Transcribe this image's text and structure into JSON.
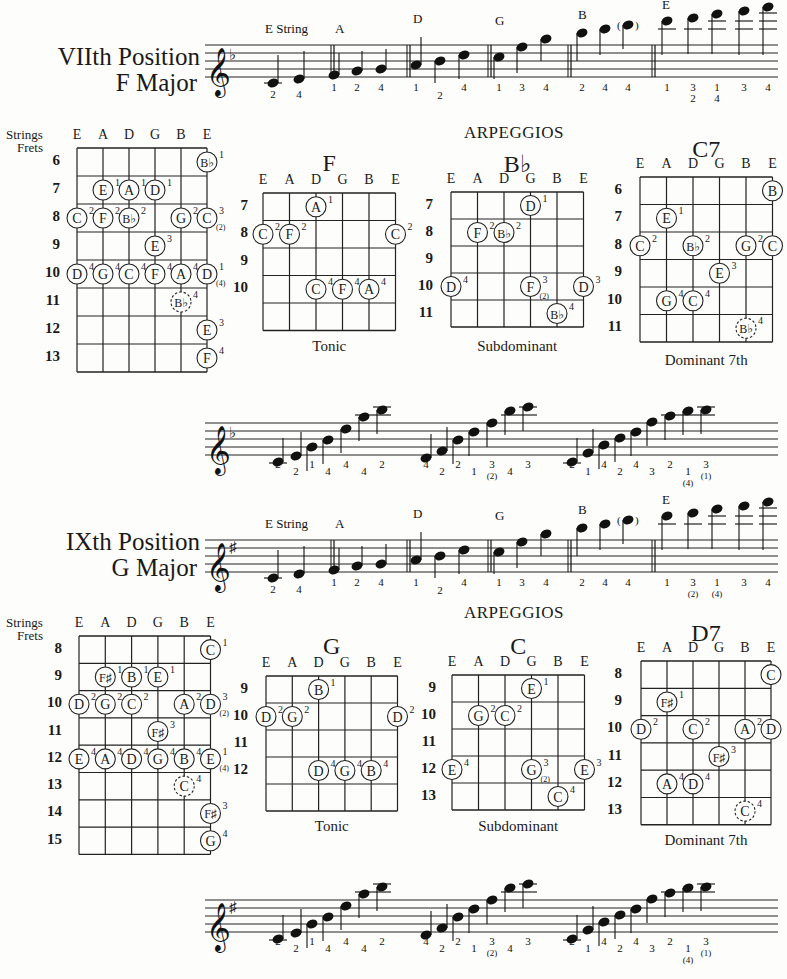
{
  "sections": [
    {
      "title_line1": "VIIth  Position",
      "title_line2": "F  Major",
      "key_signature": "flat",
      "scale_labels": [
        "E String",
        "A",
        "D",
        "G",
        "B",
        "E"
      ],
      "scale_fingerings": [
        [
          "2",
          "4"
        ],
        [
          "1",
          "2",
          "4"
        ],
        [
          "1",
          "2",
          "4"
        ],
        [
          "1",
          "3",
          "4"
        ],
        [
          "2",
          "4",
          "4"
        ],
        [
          "1",
          "3\n2",
          "1\n4",
          "3",
          "4"
        ]
      ],
      "arpeggios_heading": "ARPEGGIOS",
      "fretboard": {
        "strings_label": "Strings",
        "frets_label": "Frets",
        "strings": [
          "E",
          "A",
          "D",
          "G",
          "B",
          "E"
        ],
        "frets": [
          "6",
          "7",
          "8",
          "9",
          "10",
          "11",
          "12",
          "13"
        ],
        "notes": [
          {
            "fret": 0,
            "string": 5,
            "note": "B♭",
            "finger": "1"
          },
          {
            "fret": 1,
            "string": 1,
            "note": "E",
            "finger": "1"
          },
          {
            "fret": 1,
            "string": 2,
            "note": "A",
            "finger": "1"
          },
          {
            "fret": 1,
            "string": 3,
            "note": "D",
            "finger": "1"
          },
          {
            "fret": 2,
            "string": 0,
            "note": "C",
            "finger": "2"
          },
          {
            "fret": 2,
            "string": 1,
            "note": "F",
            "finger": "2"
          },
          {
            "fret": 2,
            "string": 2,
            "note": "B♭",
            "finger": "2"
          },
          {
            "fret": 2,
            "string": 4,
            "note": "G",
            "finger": "2"
          },
          {
            "fret": 2,
            "string": 5,
            "note": "C",
            "finger": "3",
            "alt": "(2)"
          },
          {
            "fret": 3,
            "string": 3,
            "note": "E",
            "finger": "3"
          },
          {
            "fret": 4,
            "string": 0,
            "note": "D",
            "finger": "4"
          },
          {
            "fret": 4,
            "string": 1,
            "note": "G",
            "finger": "4"
          },
          {
            "fret": 4,
            "string": 2,
            "note": "C",
            "finger": "4"
          },
          {
            "fret": 4,
            "string": 3,
            "note": "F",
            "finger": "4"
          },
          {
            "fret": 4,
            "string": 4,
            "note": "A",
            "finger": "4"
          },
          {
            "fret": 4,
            "string": 5,
            "note": "D",
            "finger": "1",
            "alt": "(4)"
          },
          {
            "fret": 5,
            "string": 4,
            "note": "B♭",
            "finger": "4",
            "dashed": true
          },
          {
            "fret": 6,
            "string": 5,
            "note": "E",
            "finger": "3"
          },
          {
            "fret": 7,
            "string": 5,
            "note": "F",
            "finger": "4"
          }
        ]
      },
      "chords": [
        {
          "name": "F",
          "caption": "Tonic",
          "strings": [
            "E",
            "A",
            "D",
            "G",
            "B",
            "E"
          ],
          "frets": [
            "7",
            "8",
            "9",
            "10",
            ""
          ],
          "notes": [
            {
              "fret": 0,
              "string": 2,
              "note": "A",
              "finger": "1"
            },
            {
              "fret": 1,
              "string": 0,
              "note": "C",
              "finger": "2"
            },
            {
              "fret": 1,
              "string": 1,
              "note": "F",
              "finger": "2"
            },
            {
              "fret": 1,
              "string": 5,
              "note": "C",
              "finger": "2"
            },
            {
              "fret": 3,
              "string": 2,
              "note": "C",
              "finger": "4"
            },
            {
              "fret": 3,
              "string": 3,
              "note": "F",
              "finger": "4"
            },
            {
              "fret": 3,
              "string": 4,
              "note": "A",
              "finger": "4"
            }
          ]
        },
        {
          "name": "B♭",
          "caption": "Subdominant",
          "strings": [
            "E",
            "A",
            "D",
            "G",
            "B",
            "E"
          ],
          "frets": [
            "7",
            "8",
            "9",
            "10",
            "11"
          ],
          "notes": [
            {
              "fret": 0,
              "string": 3,
              "note": "D",
              "finger": "1"
            },
            {
              "fret": 1,
              "string": 1,
              "note": "F",
              "finger": "2"
            },
            {
              "fret": 1,
              "string": 2,
              "note": "B♭",
              "finger": "2"
            },
            {
              "fret": 3,
              "string": 0,
              "note": "D",
              "finger": "4"
            },
            {
              "fret": 3,
              "string": 3,
              "note": "F",
              "finger": "3",
              "alt": "(2)"
            },
            {
              "fret": 3,
              "string": 5,
              "note": "D",
              "finger": "3"
            },
            {
              "fret": 4,
              "string": 4,
              "note": "B♭",
              "finger": "4"
            }
          ]
        },
        {
          "name": "C7",
          "caption": "Dominant  7th",
          "strings": [
            "E",
            "A",
            "D",
            "G",
            "B",
            "E"
          ],
          "frets": [
            "6",
            "7",
            "8",
            "9",
            "10",
            "11"
          ],
          "notes": [
            {
              "fret": 0,
              "string": 5,
              "note": "B",
              "finger": ""
            },
            {
              "fret": 1,
              "string": 1,
              "note": "E",
              "finger": "1"
            },
            {
              "fret": 2,
              "string": 0,
              "note": "C",
              "finger": "2"
            },
            {
              "fret": 2,
              "string": 2,
              "note": "B♭",
              "finger": "2"
            },
            {
              "fret": 2,
              "string": 4,
              "note": "G",
              "finger": "2"
            },
            {
              "fret": 2,
              "string": 5,
              "note": "C",
              "finger": ""
            },
            {
              "fret": 3,
              "string": 3,
              "note": "E",
              "finger": "3"
            },
            {
              "fret": 4,
              "string": 1,
              "note": "G",
              "finger": "4"
            },
            {
              "fret": 4,
              "string": 2,
              "note": "C",
              "finger": "4"
            },
            {
              "fret": 5,
              "string": 4,
              "note": "B♭",
              "finger": "4",
              "dashed": true
            }
          ]
        }
      ],
      "arpeggio_fingerings": [
        [
          "2",
          "2",
          "1",
          "4",
          "4",
          "4",
          "2"
        ],
        [
          "4",
          "2",
          "2",
          "1",
          "3\n(2)",
          "4",
          "3"
        ],
        [
          "2",
          "1",
          "4",
          "2",
          "4",
          "3",
          "2",
          "1\n(4)",
          "3\n(1)"
        ]
      ]
    },
    {
      "title_line1": "IXth  Position",
      "title_line2": "G  Major",
      "key_signature": "sharp",
      "scale_labels": [
        "E String",
        "A",
        "D",
        "G",
        "B",
        "E"
      ],
      "scale_fingerings": [
        [
          "2",
          "4"
        ],
        [
          "1",
          "2",
          "4"
        ],
        [
          "1",
          "2",
          "4"
        ],
        [
          "1",
          "3",
          "4"
        ],
        [
          "2",
          "4",
          "4"
        ],
        [
          "1",
          "3\n(2)",
          "1\n(4)",
          "3",
          "4"
        ]
      ],
      "arpeggios_heading": "ARPEGGIOS",
      "fretboard": {
        "strings_label": "Strings",
        "frets_label": "Frets",
        "strings": [
          "E",
          "A",
          "D",
          "G",
          "B",
          "E"
        ],
        "frets": [
          "8",
          "9",
          "10",
          "11",
          "12",
          "13",
          "14",
          "15"
        ],
        "notes": [
          {
            "fret": 0,
            "string": 5,
            "note": "C",
            "finger": "1"
          },
          {
            "fret": 1,
            "string": 1,
            "note": "F♯",
            "finger": "1"
          },
          {
            "fret": 1,
            "string": 2,
            "note": "B",
            "finger": "1"
          },
          {
            "fret": 1,
            "string": 3,
            "note": "E",
            "finger": "1"
          },
          {
            "fret": 2,
            "string": 0,
            "note": "D",
            "finger": "2"
          },
          {
            "fret": 2,
            "string": 1,
            "note": "G",
            "finger": "2"
          },
          {
            "fret": 2,
            "string": 2,
            "note": "C",
            "finger": "2"
          },
          {
            "fret": 2,
            "string": 4,
            "note": "A",
            "finger": "2"
          },
          {
            "fret": 2,
            "string": 5,
            "note": "D",
            "finger": "3",
            "alt": "(2)"
          },
          {
            "fret": 3,
            "string": 3,
            "note": "F♯",
            "finger": "3"
          },
          {
            "fret": 4,
            "string": 0,
            "note": "E",
            "finger": "4"
          },
          {
            "fret": 4,
            "string": 1,
            "note": "A",
            "finger": "4"
          },
          {
            "fret": 4,
            "string": 2,
            "note": "D",
            "finger": "4"
          },
          {
            "fret": 4,
            "string": 3,
            "note": "G",
            "finger": "4"
          },
          {
            "fret": 4,
            "string": 4,
            "note": "B",
            "finger": "4"
          },
          {
            "fret": 4,
            "string": 5,
            "note": "E",
            "finger": "1",
            "alt": "(4)"
          },
          {
            "fret": 5,
            "string": 4,
            "note": "C",
            "finger": "4",
            "dashed": true
          },
          {
            "fret": 6,
            "string": 5,
            "note": "F♯",
            "finger": "3"
          },
          {
            "fret": 7,
            "string": 5,
            "note": "G",
            "finger": "4"
          }
        ]
      },
      "chords": [
        {
          "name": "G",
          "caption": "Tonic",
          "strings": [
            "E",
            "A",
            "D",
            "G",
            "B",
            "E"
          ],
          "frets": [
            "9",
            "10",
            "11",
            "12",
            ""
          ],
          "notes": [
            {
              "fret": 0,
              "string": 2,
              "note": "B",
              "finger": "1"
            },
            {
              "fret": 1,
              "string": 0,
              "note": "D",
              "finger": "2"
            },
            {
              "fret": 1,
              "string": 1,
              "note": "G",
              "finger": "2"
            },
            {
              "fret": 1,
              "string": 5,
              "note": "D",
              "finger": "2"
            },
            {
              "fret": 3,
              "string": 2,
              "note": "D",
              "finger": "4"
            },
            {
              "fret": 3,
              "string": 3,
              "note": "G",
              "finger": "4"
            },
            {
              "fret": 3,
              "string": 4,
              "note": "B",
              "finger": "4"
            }
          ]
        },
        {
          "name": "C",
          "caption": "Subdominant",
          "strings": [
            "E",
            "A",
            "D",
            "G",
            "B",
            "E"
          ],
          "frets": [
            "9",
            "10",
            "11",
            "12",
            "13"
          ],
          "notes": [
            {
              "fret": 0,
              "string": 3,
              "note": "E",
              "finger": "1"
            },
            {
              "fret": 1,
              "string": 1,
              "note": "G",
              "finger": "2"
            },
            {
              "fret": 1,
              "string": 2,
              "note": "C",
              "finger": "2"
            },
            {
              "fret": 3,
              "string": 0,
              "note": "E",
              "finger": "4"
            },
            {
              "fret": 3,
              "string": 3,
              "note": "G",
              "finger": "3",
              "alt": "(2)"
            },
            {
              "fret": 3,
              "string": 5,
              "note": "E",
              "finger": "3"
            },
            {
              "fret": 4,
              "string": 4,
              "note": "C",
              "finger": "4"
            }
          ]
        },
        {
          "name": "D7",
          "caption": "Dominant  7th",
          "strings": [
            "E",
            "A",
            "D",
            "G",
            "B",
            "E"
          ],
          "frets": [
            "8",
            "9",
            "10",
            "11",
            "12",
            "13"
          ],
          "notes": [
            {
              "fret": 0,
              "string": 5,
              "note": "C",
              "finger": ""
            },
            {
              "fret": 1,
              "string": 1,
              "note": "F♯",
              "finger": "1"
            },
            {
              "fret": 2,
              "string": 0,
              "note": "D",
              "finger": "2"
            },
            {
              "fret": 2,
              "string": 2,
              "note": "C",
              "finger": "2"
            },
            {
              "fret": 2,
              "string": 4,
              "note": "A",
              "finger": "2"
            },
            {
              "fret": 2,
              "string": 5,
              "note": "D",
              "finger": ""
            },
            {
              "fret": 3,
              "string": 3,
              "note": "F♯",
              "finger": "3"
            },
            {
              "fret": 4,
              "string": 1,
              "note": "A",
              "finger": "4"
            },
            {
              "fret": 4,
              "string": 2,
              "note": "D",
              "finger": "4"
            },
            {
              "fret": 5,
              "string": 4,
              "note": "C",
              "finger": "4",
              "dashed": true
            }
          ]
        }
      ],
      "arpeggio_fingerings": [
        [
          "2",
          "2",
          "1",
          "4",
          "4",
          "4",
          "2"
        ],
        [
          "4",
          "2",
          "2",
          "1",
          "3\n(2)",
          "4",
          "3"
        ],
        [
          "2",
          "1",
          "4",
          "2",
          "4",
          "3",
          "2",
          "1\n(4)",
          "3\n(1)"
        ]
      ]
    }
  ]
}
